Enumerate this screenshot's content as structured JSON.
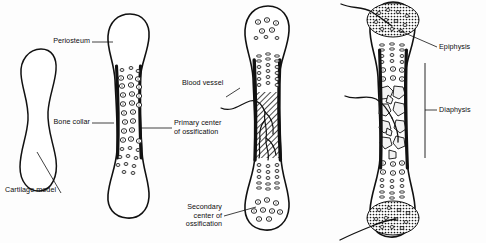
{
  "figure": {
    "background_color": "#fdfdfd",
    "ink_color": "#0d0d0d",
    "stages": [
      {
        "id": "stage-1-cartilage-model",
        "order": 1,
        "description": "Hyaline cartilage model"
      },
      {
        "id": "stage-2-bone-collar",
        "order": 2,
        "description": "Periosteal bone collar forms around hypertrophied chondrocytes"
      },
      {
        "id": "stage-3-primary-center",
        "order": 3,
        "description": "Primary ossification center with invading blood vessel; secondary centers appear"
      },
      {
        "id": "stage-4-epiphysis-diaphysis",
        "order": 4,
        "description": "Ossified epiphyses and diaphysis separated by growth plates"
      }
    ]
  },
  "labels": {
    "cartilage_model": "Cartilage model",
    "periosteum": "Periosteum",
    "bone_collar": "Bone collar",
    "primary_center": "Primary center\nof ossification",
    "blood_vessel": "Blood vessel",
    "secondary_center": "Secondary\ncenter of\nossification",
    "epiphysis": "Epiphysis",
    "diaphysis": "Diaphysis"
  }
}
